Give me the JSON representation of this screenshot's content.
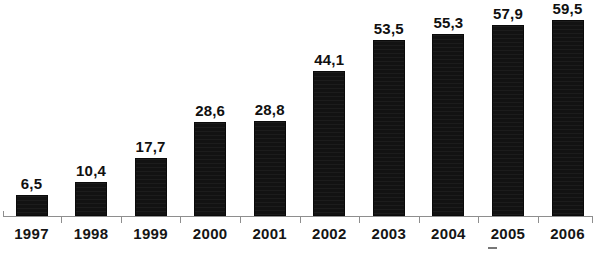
{
  "chart_data": {
    "type": "bar",
    "title": "",
    "subtitle": "",
    "xlabel": "",
    "ylabel": "",
    "categories": [
      "1997",
      "1998",
      "1999",
      "2000",
      "2001",
      "2002",
      "2003",
      "2004",
      "2005",
      "2006"
    ],
    "values": [
      6.5,
      10.4,
      17.7,
      28.6,
      28.8,
      44.1,
      53.5,
      55.3,
      57.9,
      59.5
    ],
    "value_labels": [
      "6,5",
      "10,4",
      "17,7",
      "28,6",
      "28,8",
      "44,1",
      "53,5",
      "55,3",
      "57,9",
      "59,5"
    ],
    "decimal_separator": ",",
    "ylim": [
      0,
      62
    ],
    "grid": false,
    "legend": null,
    "legend_position": "none",
    "bar_color": "#121212",
    "axis_color": "#8e8e8e",
    "background_color": "#ffffff",
    "data_labels_shown": true,
    "y_axis_shown": false,
    "y_tick_labels": [],
    "annotations": []
  },
  "artifacts": {
    "scan_mark": "-"
  }
}
